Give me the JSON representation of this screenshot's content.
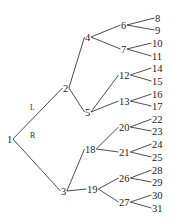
{
  "diagram": {
    "type": "binary-tree",
    "edge_labels": {
      "left": "L",
      "right": "R"
    },
    "nodes": [
      {
        "id": "1",
        "label": "1",
        "x": 7,
        "y": 139
      },
      {
        "id": "2",
        "label": "2",
        "x": 63,
        "y": 88
      },
      {
        "id": "3",
        "label": "3",
        "x": 61,
        "y": 191
      },
      {
        "id": "4",
        "label": "4",
        "x": 85,
        "y": 37
      },
      {
        "id": "5",
        "label": "5",
        "x": 85,
        "y": 112
      },
      {
        "id": "18",
        "label": "18",
        "x": 85,
        "y": 149
      },
      {
        "id": "19",
        "label": "19",
        "x": 87,
        "y": 189
      },
      {
        "id": "6",
        "label": "6",
        "x": 121,
        "y": 25
      },
      {
        "id": "7",
        "label": "7",
        "x": 121,
        "y": 49
      },
      {
        "id": "12",
        "label": "12",
        "x": 119,
        "y": 75
      },
      {
        "id": "13",
        "label": "13",
        "x": 119,
        "y": 101
      },
      {
        "id": "20",
        "label": "20",
        "x": 119,
        "y": 127
      },
      {
        "id": "21",
        "label": "21",
        "x": 119,
        "y": 152
      },
      {
        "id": "26",
        "label": "26",
        "x": 119,
        "y": 178
      },
      {
        "id": "27",
        "label": "27",
        "x": 119,
        "y": 202
      },
      {
        "id": "8",
        "label": "8",
        "x": 155,
        "y": 18
      },
      {
        "id": "9",
        "label": "9",
        "x": 155,
        "y": 30
      },
      {
        "id": "10",
        "label": "10",
        "x": 152,
        "y": 43
      },
      {
        "id": "11",
        "label": "11",
        "x": 152,
        "y": 56
      },
      {
        "id": "14",
        "label": "14",
        "x": 152,
        "y": 68
      },
      {
        "id": "15",
        "label": "15",
        "x": 152,
        "y": 81
      },
      {
        "id": "16",
        "label": "16",
        "x": 152,
        "y": 94
      },
      {
        "id": "17",
        "label": "17",
        "x": 152,
        "y": 106
      },
      {
        "id": "22",
        "label": "22",
        "x": 152,
        "y": 119
      },
      {
        "id": "23",
        "label": "23",
        "x": 152,
        "y": 131
      },
      {
        "id": "24",
        "label": "24",
        "x": 152,
        "y": 144
      },
      {
        "id": "25",
        "label": "25",
        "x": 152,
        "y": 157
      },
      {
        "id": "28",
        "label": "28",
        "x": 152,
        "y": 170
      },
      {
        "id": "29",
        "label": "29",
        "x": 152,
        "y": 182
      },
      {
        "id": "30",
        "label": "30",
        "x": 152,
        "y": 195
      },
      {
        "id": "31",
        "label": "31",
        "x": 152,
        "y": 208
      }
    ],
    "edges": [
      {
        "from": "1",
        "to": "2",
        "label": "L"
      },
      {
        "from": "1",
        "to": "3",
        "label": "R"
      },
      {
        "from": "2",
        "to": "4"
      },
      {
        "from": "2",
        "to": "5"
      },
      {
        "from": "3",
        "to": "18"
      },
      {
        "from": "3",
        "to": "19"
      },
      {
        "from": "4",
        "to": "6"
      },
      {
        "from": "4",
        "to": "7"
      },
      {
        "from": "5",
        "to": "12"
      },
      {
        "from": "5",
        "to": "13"
      },
      {
        "from": "18",
        "to": "20"
      },
      {
        "from": "18",
        "to": "21"
      },
      {
        "from": "19",
        "to": "26"
      },
      {
        "from": "19",
        "to": "27"
      },
      {
        "from": "6",
        "to": "8"
      },
      {
        "from": "6",
        "to": "9"
      },
      {
        "from": "7",
        "to": "10"
      },
      {
        "from": "7",
        "to": "11"
      },
      {
        "from": "12",
        "to": "14"
      },
      {
        "from": "12",
        "to": "15"
      },
      {
        "from": "13",
        "to": "16"
      },
      {
        "from": "13",
        "to": "17"
      },
      {
        "from": "20",
        "to": "22"
      },
      {
        "from": "20",
        "to": "23"
      },
      {
        "from": "21",
        "to": "24"
      },
      {
        "from": "21",
        "to": "25"
      },
      {
        "from": "26",
        "to": "28"
      },
      {
        "from": "26",
        "to": "29"
      },
      {
        "from": "27",
        "to": "30"
      },
      {
        "from": "27",
        "to": "31"
      }
    ],
    "edge_label_positions": {
      "L": {
        "x": 30,
        "y": 110
      },
      "R": {
        "x": 30,
        "y": 138
      }
    }
  }
}
